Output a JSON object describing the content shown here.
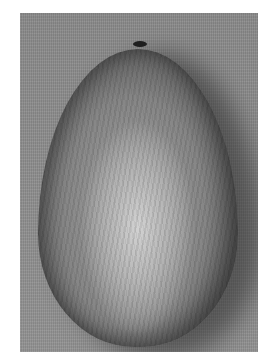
{
  "image": {
    "subject": "egg-shaped seed",
    "style": "grayscale photograph",
    "colors": {
      "background": "#8d8d8d",
      "seed_highlight": "#d2d2d2",
      "seed_mid": "#a9a9a9",
      "seed_edge": "#4a4a4a",
      "tip": "#1e1e1e",
      "page": "#ffffff"
    }
  }
}
